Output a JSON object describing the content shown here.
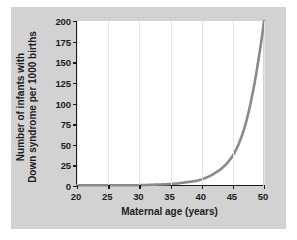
{
  "figure": {
    "background_color": "#ffffff",
    "panel_color": "#d2d2d2",
    "plot_background": "#ffffff",
    "axis_color": "#1a1a1a",
    "grid_color": "#e4e4e4",
    "curve_color": "#8a8a8a"
  },
  "chart_data": {
    "type": "line",
    "title": "",
    "xlabel": "Maternal age (years)",
    "ylabel": "Number of infants with Down syndrome per 1000 births",
    "ylabel_line1": "Number of infants with",
    "ylabel_line2": "Down syndrome per 1000 births",
    "xlim": [
      20,
      50
    ],
    "ylim": [
      0,
      200
    ],
    "xticks": [
      20,
      25,
      30,
      35,
      40,
      45,
      50
    ],
    "xtick_labels": [
      "20",
      "25",
      "30",
      "35",
      "40",
      "45",
      "50"
    ],
    "yticks": [
      0,
      25,
      50,
      75,
      100,
      125,
      150,
      175,
      200
    ],
    "ytick_labels": [
      "0",
      "25",
      "50",
      "75",
      "100",
      "125",
      "150",
      "175",
      "200"
    ],
    "grid": "vertical-only",
    "legend": "none",
    "series": [
      {
        "name": "Down syndrome incidence",
        "color": "#8a8a8a",
        "line_width": 2.6,
        "x": [
          20,
          22,
          24,
          26,
          28,
          30,
          32,
          34,
          35,
          36,
          37,
          38,
          39,
          40,
          41,
          42,
          43,
          44,
          45,
          46,
          47,
          48,
          49,
          50
        ],
        "y": [
          1,
          1,
          1,
          1,
          1,
          1,
          1.5,
          2,
          2.5,
          3,
          4,
          5,
          6,
          8,
          11,
          15,
          20,
          27,
          37,
          52,
          74,
          106,
          148,
          200
        ]
      }
    ]
  }
}
